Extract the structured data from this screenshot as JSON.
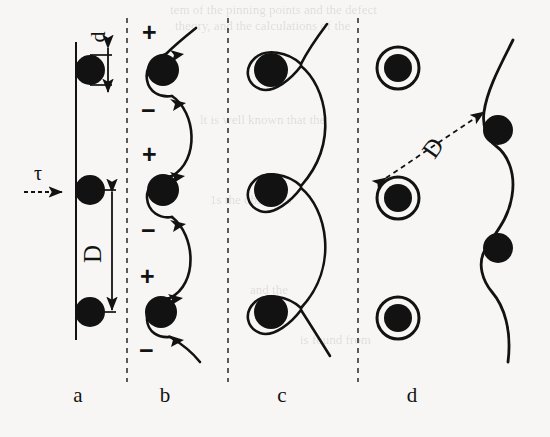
{
  "figure": {
    "background_color": "#f7f6f4",
    "ink_color": "#121212",
    "width": 550,
    "height": 437
  },
  "panels": [
    {
      "id": "a",
      "label": "a",
      "label_x": 78,
      "label_y": 383,
      "description": "Row of particles on a straight glide plane with a dislocation line under stress tau",
      "particle_count": 3,
      "annotations": [
        {
          "name": "particle-diameter",
          "symbol": "d",
          "rotated": true
        },
        {
          "name": "particle-spacing",
          "symbol": "D",
          "rotated": true
        },
        {
          "name": "applied-shear-stress",
          "symbol": "τ",
          "rotated": false
        }
      ]
    },
    {
      "id": "b",
      "label": "b",
      "label_x": 165,
      "label_y": 383,
      "description": "Dislocation bowing between particles with positive and negative segment signs",
      "particle_count": 3,
      "annotations": [
        {
          "name": "positive-sign",
          "symbol": "+",
          "rotated": false
        },
        {
          "name": "negative-sign",
          "symbol": "−",
          "rotated": false
        }
      ]
    },
    {
      "id": "c",
      "label": "c",
      "label_x": 282,
      "label_y": 383,
      "description": "Orowan loops formed around particles as the dislocation bows out",
      "particle_count": 3,
      "annotations": []
    },
    {
      "id": "d",
      "label": "d",
      "label_x": 412,
      "label_y": 383,
      "description": "Orowan loops left behind at particles while the dislocation line moves on",
      "particle_count": 5,
      "annotations": [
        {
          "name": "particle-spacing",
          "symbol": "D",
          "rotated": true
        }
      ]
    }
  ],
  "separators": {
    "style": "dashed",
    "count": 3,
    "x_positions": [
      127,
      228,
      358
    ],
    "y_top": 18,
    "y_bottom": 382
  },
  "panel_a_geometry": {
    "glide_line_x": 76,
    "particle_x": 90,
    "particle_y": [
      70,
      190,
      312
    ],
    "particle_radius": 15,
    "tau_arrow_y": 190,
    "d_label_x": 99,
    "d_label_y": 37,
    "D_label_x": 94,
    "D_label_y": 253
  },
  "panel_b_geometry": {
    "particle_x": 163,
    "particle_y": [
      70,
      190,
      312
    ],
    "particle_radius": 16
  },
  "panel_c_geometry": {
    "particle_x": 271,
    "particle_y": [
      70,
      190,
      312
    ],
    "particle_radius": 17,
    "cusp_x": 300
  },
  "panel_d_geometry": {
    "looped_particle_x": 398,
    "looped_particle_y": [
      68,
      198,
      318
    ],
    "line_particle_x": 498,
    "line_particle_y": [
      130,
      248
    ],
    "particle_radius": 14,
    "ring_radius": 21,
    "D_label_x": 432,
    "D_label_y": 150
  },
  "ghost_text": [
    {
      "text": "tem of the pinning points and the defect",
      "x": 170,
      "y": 10,
      "size": 13
    },
    {
      "text": "theory, and the calculations of the",
      "x": 175,
      "y": 26,
      "size": 13
    },
    {
      "text": "lt is well known that the",
      "x": 200,
      "y": 120,
      "size": 13
    },
    {
      "text": "1s the obstacles",
      "x": 210,
      "y": 200,
      "size": 13
    },
    {
      "text": "and the",
      "x": 250,
      "y": 290,
      "size": 13
    },
    {
      "text": "is found from",
      "x": 300,
      "y": 340,
      "size": 13
    }
  ]
}
